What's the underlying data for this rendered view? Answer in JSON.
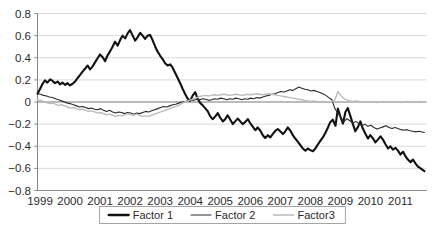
{
  "chart_data": {
    "type": "line",
    "title": "",
    "subtitle": "",
    "xlabel": "",
    "ylabel": "",
    "xlim": [
      1999,
      2011.95
    ],
    "ylim": [
      -0.8,
      0.8
    ],
    "grid": true,
    "legend_position": "bottom-center",
    "x_tick_labels": [
      "1999",
      "2000",
      "2001",
      "2002",
      "2003",
      "2004",
      "2005",
      "2006",
      "2007",
      "2008",
      "2009",
      "2010",
      "2011"
    ],
    "x_tick_values": [
      1999,
      2000,
      2001,
      2002,
      2003,
      2004,
      2005,
      2006,
      2007,
      2008,
      2009,
      2010,
      2011
    ],
    "y_tick_labels": [
      "0.8",
      "0.6",
      "0.4",
      "0.2",
      "0",
      "-0.2",
      "-0.4",
      "-0.6",
      "-0.8"
    ],
    "y_tick_values": [
      0.8,
      0.6,
      0.4,
      0.2,
      0,
      -0.2,
      -0.4,
      -0.6,
      -0.8
    ],
    "series": [
      {
        "name": "Factor 1",
        "color": "#111111",
        "width": 2.1,
        "x": [
          1999.0,
          1999.08,
          1999.17,
          1999.25,
          1999.33,
          1999.42,
          1999.5,
          1999.58,
          1999.67,
          1999.75,
          1999.83,
          1999.92,
          2000.0,
          2000.08,
          2000.17,
          2000.25,
          2000.33,
          2000.42,
          2000.5,
          2000.58,
          2000.67,
          2000.75,
          2000.83,
          2000.92,
          2001.0,
          2001.08,
          2001.17,
          2001.25,
          2001.33,
          2001.42,
          2001.5,
          2001.58,
          2001.67,
          2001.75,
          2001.83,
          2001.92,
          2002.0,
          2002.08,
          2002.17,
          2002.25,
          2002.33,
          2002.42,
          2002.5,
          2002.58,
          2002.67,
          2002.75,
          2002.83,
          2002.92,
          2003.0,
          2003.08,
          2003.17,
          2003.25,
          2003.33,
          2003.42,
          2003.5,
          2003.58,
          2003.67,
          2003.75,
          2003.83,
          2003.92,
          2004.0,
          2004.08,
          2004.17,
          2004.25,
          2004.33,
          2004.42,
          2004.5,
          2004.58,
          2004.67,
          2004.75,
          2004.83,
          2004.92,
          2005.0,
          2005.08,
          2005.17,
          2005.25,
          2005.33,
          2005.42,
          2005.5,
          2005.58,
          2005.67,
          2005.75,
          2005.83,
          2005.92,
          2006.0,
          2006.08,
          2006.17,
          2006.25,
          2006.33,
          2006.42,
          2006.5,
          2006.58,
          2006.67,
          2006.75,
          2006.83,
          2006.92,
          2007.0,
          2007.08,
          2007.17,
          2007.25,
          2007.33,
          2007.42,
          2007.5,
          2007.58,
          2007.67,
          2007.75,
          2007.83,
          2007.92,
          2008.0,
          2008.08,
          2008.17,
          2008.25,
          2008.33,
          2008.42,
          2008.5,
          2008.58,
          2008.67,
          2008.75,
          2008.83,
          2008.92,
          2009.0,
          2009.08,
          2009.17,
          2009.25,
          2009.33,
          2009.42,
          2009.5,
          2009.58,
          2009.67,
          2009.75,
          2009.83,
          2009.92,
          2010.0,
          2010.08,
          2010.17,
          2010.25,
          2010.33,
          2010.42,
          2010.5,
          2010.58,
          2010.67,
          2010.75,
          2010.83,
          2010.92,
          2011.0,
          2011.08,
          2011.17,
          2011.25,
          2011.33,
          2011.42,
          2011.5,
          2011.58,
          2011.67,
          2011.75,
          2011.88
        ],
        "y": [
          0.075,
          0.115,
          0.165,
          0.195,
          0.175,
          0.205,
          0.19,
          0.17,
          0.185,
          0.16,
          0.175,
          0.155,
          0.17,
          0.15,
          0.165,
          0.185,
          0.215,
          0.245,
          0.275,
          0.3,
          0.33,
          0.295,
          0.32,
          0.36,
          0.395,
          0.43,
          0.405,
          0.37,
          0.42,
          0.46,
          0.5,
          0.545,
          0.51,
          0.56,
          0.6,
          0.575,
          0.62,
          0.65,
          0.6,
          0.555,
          0.585,
          0.625,
          0.6,
          0.57,
          0.6,
          0.605,
          0.56,
          0.5,
          0.455,
          0.42,
          0.385,
          0.35,
          0.33,
          0.34,
          0.31,
          0.265,
          0.215,
          0.17,
          0.12,
          0.07,
          0.03,
          0.01,
          0.06,
          0.09,
          0.03,
          -0.01,
          -0.03,
          -0.055,
          -0.085,
          -0.13,
          -0.155,
          -0.13,
          -0.1,
          -0.14,
          -0.175,
          -0.155,
          -0.12,
          -0.16,
          -0.2,
          -0.175,
          -0.15,
          -0.175,
          -0.2,
          -0.18,
          -0.155,
          -0.19,
          -0.225,
          -0.255,
          -0.23,
          -0.26,
          -0.3,
          -0.325,
          -0.3,
          -0.32,
          -0.29,
          -0.26,
          -0.245,
          -0.265,
          -0.29,
          -0.265,
          -0.23,
          -0.26,
          -0.3,
          -0.33,
          -0.36,
          -0.39,
          -0.42,
          -0.44,
          -0.42,
          -0.435,
          -0.445,
          -0.42,
          -0.385,
          -0.35,
          -0.32,
          -0.28,
          -0.23,
          -0.18,
          -0.16,
          -0.215,
          -0.06,
          -0.13,
          -0.195,
          -0.09,
          -0.055,
          -0.13,
          -0.2,
          -0.265,
          -0.225,
          -0.175,
          -0.24,
          -0.29,
          -0.33,
          -0.3,
          -0.33,
          -0.365,
          -0.34,
          -0.31,
          -0.34,
          -0.38,
          -0.42,
          -0.4,
          -0.43,
          -0.415,
          -0.44,
          -0.475,
          -0.45,
          -0.49,
          -0.52,
          -0.545,
          -0.52,
          -0.555,
          -0.585,
          -0.6,
          -0.625
        ]
      },
      {
        "name": "Factor 2",
        "color": "#2a2a2a",
        "width": 1.1,
        "x": [
          1999.0,
          1999.1,
          1999.2,
          1999.3,
          1999.4,
          1999.5,
          1999.6,
          1999.7,
          1999.8,
          1999.9,
          2000.0,
          2000.1,
          2000.2,
          2000.3,
          2000.4,
          2000.5,
          2000.6,
          2000.7,
          2000.8,
          2000.9,
          2001.0,
          2001.1,
          2001.2,
          2001.3,
          2001.4,
          2001.5,
          2001.6,
          2001.7,
          2001.8,
          2001.9,
          2002.0,
          2002.1,
          2002.2,
          2002.3,
          2002.4,
          2002.5,
          2002.6,
          2002.7,
          2002.8,
          2002.9,
          2003.0,
          2003.1,
          2003.2,
          2003.3,
          2003.4,
          2003.5,
          2003.6,
          2003.7,
          2003.8,
          2003.9,
          2004.0,
          2004.1,
          2004.2,
          2004.3,
          2004.4,
          2004.5,
          2004.6,
          2004.7,
          2004.8,
          2004.9,
          2005.0,
          2005.1,
          2005.2,
          2005.3,
          2005.4,
          2005.5,
          2005.6,
          2005.7,
          2005.8,
          2005.9,
          2006.0,
          2006.1,
          2006.2,
          2006.3,
          2006.4,
          2006.5,
          2006.6,
          2006.7,
          2006.8,
          2006.9,
          2007.0,
          2007.1,
          2007.2,
          2007.3,
          2007.4,
          2007.5,
          2007.6,
          2007.7,
          2007.8,
          2007.9,
          2008.0,
          2008.1,
          2008.2,
          2008.3,
          2008.4,
          2008.5,
          2008.6,
          2008.7,
          2008.8,
          2008.9,
          2009.0,
          2009.1,
          2009.2,
          2009.3,
          2009.4,
          2009.5,
          2009.6,
          2009.7,
          2009.8,
          2009.9,
          2010.0,
          2010.1,
          2010.2,
          2010.3,
          2010.4,
          2010.5,
          2010.6,
          2010.7,
          2010.8,
          2010.9,
          2011.0,
          2011.1,
          2011.2,
          2011.3,
          2011.4,
          2011.5,
          2011.6,
          2011.7,
          2011.88
        ],
        "y": [
          0.075,
          0.07,
          0.06,
          0.055,
          0.045,
          0.04,
          0.03,
          0.02,
          0.01,
          0.0,
          -0.01,
          -0.015,
          -0.025,
          -0.035,
          -0.045,
          -0.04,
          -0.05,
          -0.06,
          -0.055,
          -0.065,
          -0.07,
          -0.06,
          -0.075,
          -0.085,
          -0.075,
          -0.09,
          -0.1,
          -0.09,
          -0.095,
          -0.105,
          -0.095,
          -0.1,
          -0.11,
          -0.1,
          -0.105,
          -0.095,
          -0.085,
          -0.09,
          -0.08,
          -0.07,
          -0.06,
          -0.05,
          -0.04,
          -0.045,
          -0.035,
          -0.025,
          -0.02,
          -0.01,
          0.0,
          0.005,
          0.01,
          0.02,
          0.015,
          0.025,
          0.02,
          0.03,
          0.025,
          0.015,
          0.02,
          0.03,
          0.025,
          0.035,
          0.03,
          0.02,
          0.03,
          0.025,
          0.035,
          0.03,
          0.02,
          0.03,
          0.025,
          0.035,
          0.03,
          0.04,
          0.035,
          0.045,
          0.055,
          0.06,
          0.07,
          0.075,
          0.085,
          0.095,
          0.09,
          0.1,
          0.11,
          0.105,
          0.12,
          0.135,
          0.125,
          0.115,
          0.11,
          0.1,
          0.105,
          0.095,
          0.085,
          0.075,
          0.06,
          0.04,
          0.02,
          -0.06,
          -0.1,
          -0.14,
          -0.18,
          -0.15,
          -0.17,
          -0.19,
          -0.175,
          -0.195,
          -0.215,
          -0.2,
          -0.22,
          -0.21,
          -0.23,
          -0.245,
          -0.235,
          -0.225,
          -0.215,
          -0.23,
          -0.24,
          -0.23,
          -0.24,
          -0.25,
          -0.255,
          -0.25,
          -0.26,
          -0.265,
          -0.27,
          -0.265,
          -0.275
        ]
      },
      {
        "name": "Factor3",
        "color": "#bcbcbc",
        "width": 1.4,
        "x": [
          1999.0,
          1999.1,
          1999.2,
          1999.3,
          1999.4,
          1999.5,
          1999.6,
          1999.7,
          1999.8,
          1999.9,
          2000.0,
          2000.1,
          2000.2,
          2000.3,
          2000.4,
          2000.5,
          2000.6,
          2000.7,
          2000.8,
          2000.9,
          2001.0,
          2001.1,
          2001.2,
          2001.3,
          2001.4,
          2001.5,
          2001.6,
          2001.7,
          2001.8,
          2001.9,
          2002.0,
          2002.1,
          2002.2,
          2002.3,
          2002.4,
          2002.5,
          2002.6,
          2002.7,
          2002.8,
          2002.9,
          2003.0,
          2003.1,
          2003.2,
          2003.3,
          2003.4,
          2003.5,
          2003.6,
          2003.7,
          2003.8,
          2003.9,
          2004.0,
          2004.1,
          2004.2,
          2004.3,
          2004.4,
          2004.5,
          2004.6,
          2004.7,
          2004.8,
          2004.9,
          2005.0,
          2005.1,
          2005.2,
          2005.3,
          2005.4,
          2005.5,
          2005.6,
          2005.7,
          2005.8,
          2005.9,
          2006.0,
          2006.1,
          2006.2,
          2006.3,
          2006.4,
          2006.5,
          2006.6,
          2006.7,
          2006.8,
          2006.9,
          2007.0,
          2007.1,
          2007.2,
          2007.3,
          2007.4,
          2007.5,
          2007.6,
          2007.7,
          2007.8,
          2007.9,
          2008.0,
          2008.1,
          2008.2,
          2008.3,
          2008.4,
          2008.5,
          2008.6,
          2008.7,
          2008.8,
          2008.9,
          2009.0,
          2009.1,
          2009.2,
          2009.3,
          2009.4,
          2009.5,
          2009.6,
          2009.7,
          2009.8,
          2009.9,
          2010.0,
          2010.1,
          2010.2,
          2010.3,
          2010.4,
          2010.5,
          2010.6,
          2010.7,
          2010.8,
          2010.9,
          2011.0,
          2011.1,
          2011.2,
          2011.3,
          2011.4,
          2011.5,
          2011.6,
          2011.7,
          2011.88
        ],
        "y": [
          0.02,
          0.015,
          0.005,
          -0.005,
          -0.015,
          -0.01,
          -0.02,
          -0.03,
          -0.025,
          -0.035,
          -0.045,
          -0.055,
          -0.05,
          -0.06,
          -0.07,
          -0.065,
          -0.075,
          -0.085,
          -0.08,
          -0.09,
          -0.1,
          -0.095,
          -0.105,
          -0.115,
          -0.11,
          -0.12,
          -0.13,
          -0.12,
          -0.125,
          -0.115,
          -0.105,
          -0.115,
          -0.12,
          -0.11,
          -0.12,
          -0.13,
          -0.125,
          -0.13,
          -0.12,
          -0.11,
          -0.1,
          -0.09,
          -0.08,
          -0.07,
          -0.06,
          -0.05,
          -0.04,
          -0.03,
          -0.015,
          0.0,
          0.01,
          0.02,
          0.03,
          0.04,
          0.05,
          0.055,
          0.06,
          0.055,
          0.06,
          0.065,
          0.06,
          0.065,
          0.07,
          0.065,
          0.06,
          0.065,
          0.07,
          0.065,
          0.06,
          0.065,
          0.07,
          0.065,
          0.07,
          0.075,
          0.07,
          0.065,
          0.07,
          0.075,
          0.07,
          0.065,
          0.06,
          0.055,
          0.05,
          0.045,
          0.04,
          0.035,
          0.03,
          0.025,
          0.02,
          0.015,
          0.01,
          0.005,
          0.01,
          0.005,
          0.0,
          0.005,
          0.0,
          -0.005,
          0.0,
          0.02,
          0.095,
          0.06,
          0.03,
          0.02,
          0.01,
          0.005,
          0.01,
          0.005,
          0.0,
          0.005,
          0.0,
          0.005,
          0.0,
          -0.005,
          0.0,
          0.005,
          0.0,
          -0.005,
          0.0,
          0.005,
          0.0,
          -0.005,
          0.0,
          0.005,
          0.0,
          -0.005,
          0.0,
          0.005,
          0.0
        ]
      }
    ]
  },
  "legend": {
    "entries": [
      {
        "label": "Factor 1",
        "color": "#111111",
        "width": 2.3
      },
      {
        "label": "Factor 2",
        "color": "#2a2a2a",
        "width": 1.2
      },
      {
        "label": "Factor3",
        "color": "#bcbcbc",
        "width": 1.5
      }
    ]
  }
}
